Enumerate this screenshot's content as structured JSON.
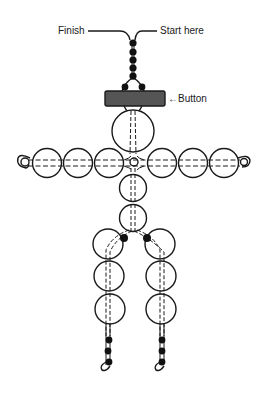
{
  "diagram": {
    "labels": {
      "finish": "Finish",
      "start": "Start here",
      "button": "←Button"
    },
    "colors": {
      "outline": "#1a1a1a",
      "black_bead": "#111111",
      "button_fill": "#555555",
      "background": "#ffffff"
    },
    "parts": {
      "hanging_chain_beads": 5,
      "head_bead": 1,
      "arm_beads_per_side": 3,
      "center_small_bead": 1,
      "torso_beads": 2,
      "hip_black_beads": 2,
      "leg_beads_per_side": 3,
      "foot_black_beads_per_side": 3
    }
  }
}
